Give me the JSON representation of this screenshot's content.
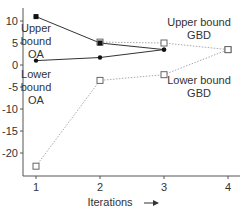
{
  "chart_data": {
    "type": "line",
    "title": "",
    "xlabel": "Iterations",
    "ylabel": "",
    "x": [
      1,
      2,
      3,
      4
    ],
    "xlim": [
      0.8,
      4.2
    ],
    "ylim": [
      -25,
      12
    ],
    "xticks": [
      "1",
      "2",
      "3",
      "4"
    ],
    "yticks": [
      "10",
      "5",
      "0",
      "-5",
      "-10",
      "-15",
      "-20"
    ],
    "grid": false,
    "series": [
      {
        "name": "Upper bound OA",
        "x": [
          1,
          2,
          3
        ],
        "values": [
          11,
          5,
          3.5
        ],
        "style": "solid",
        "marker": "filled-circle",
        "color": "#333333"
      },
      {
        "name": "Lower bound OA",
        "x": [
          1,
          2,
          3
        ],
        "values": [
          1,
          1.7,
          3.5
        ],
        "style": "solid",
        "marker": "filled-circle",
        "color": "#333333"
      },
      {
        "name": "Upper bound GBD",
        "x": [
          2,
          3,
          4
        ],
        "values": [
          5.2,
          5,
          3.5
        ],
        "style": "dotted",
        "marker": "open-square",
        "color": "#aaaaaa"
      },
      {
        "name": "Lower bound GBD",
        "x": [
          1,
          2,
          3,
          4
        ],
        "values": [
          -23,
          -3.5,
          -2.2,
          3.5
        ],
        "style": "dotted",
        "marker": "open-square",
        "color": "#aaaaaa"
      }
    ],
    "annotations": [
      {
        "text": [
          "Upper",
          "bound",
          "OA"
        ]
      },
      {
        "text": [
          "Lower",
          "bound",
          "OA"
        ]
      },
      {
        "text": [
          "Upper bound",
          "GBD"
        ]
      },
      {
        "text": [
          "Lower bound",
          "GBD"
        ]
      }
    ],
    "xlabel_arrow": "→"
  }
}
